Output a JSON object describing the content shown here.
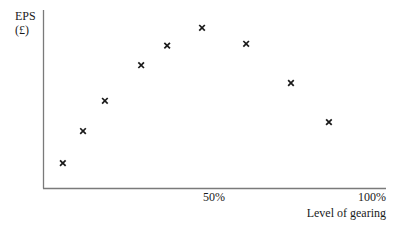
{
  "chart_data": {
    "type": "scatter",
    "title": "",
    "xlabel": "Level of gearing",
    "ylabel": "EPS (£)",
    "ylabel_lines": [
      "EPS",
      "(£)"
    ],
    "xlim": [
      0,
      100
    ],
    "ylim": [
      0,
      100
    ],
    "x_ticks": [
      {
        "value": 50,
        "label": "50%"
      },
      {
        "value": 100,
        "label": "100%"
      }
    ],
    "y_ticks": [],
    "grid": false,
    "legend": null,
    "marker": "x",
    "series": [
      {
        "name": "EPS vs gearing",
        "x": [
          5.8,
          11.7,
          18.1,
          28.7,
          36.3,
          46.5,
          59.4,
          72.5,
          83.6
        ],
        "y": [
          14,
          32,
          49,
          69,
          80,
          90,
          81,
          59,
          37
        ]
      }
    ],
    "note": "Y-axis has no numeric scale; y values are relative estimates (0 = x-axis, 100 = top of y-axis)."
  },
  "colors": {
    "axis": "#7a7a7a",
    "marker": "#1a1a1a",
    "text": "#1a1a1a",
    "background": "#ffffff"
  }
}
